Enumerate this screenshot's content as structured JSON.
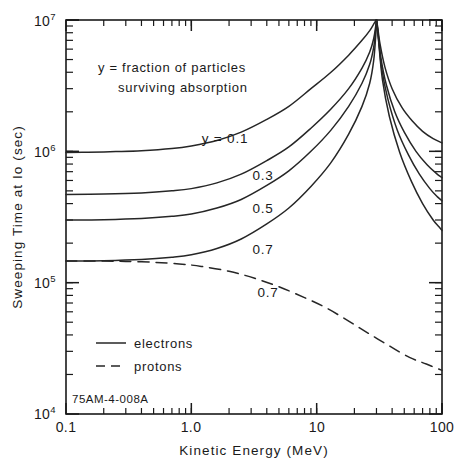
{
  "figure": {
    "id_label": "75AM-4-008A",
    "annotation_line1": "y = fraction of particles",
    "annotation_line2": "surviving absorption"
  },
  "chart_data": {
    "type": "line",
    "title": "",
    "xlabel": "Kinetic Energy (MeV)",
    "ylabel": "Sweeping Time at Io (sec)",
    "xscale": "log",
    "yscale": "log",
    "xlim": [
      0.1,
      100
    ],
    "ylim": [
      10000,
      10000000
    ],
    "grid": false,
    "xtick_labels": [
      "0.1",
      "1.0",
      "10",
      "100"
    ],
    "xtick_values": [
      0.1,
      1.0,
      10,
      100
    ],
    "ytick_labels": [
      "10",
      "10",
      "10",
      "10"
    ],
    "ytick_exponents": [
      "4",
      "5",
      "6",
      "7"
    ],
    "ytick_values": [
      10000,
      100000,
      1000000,
      10000000
    ],
    "annotations": [
      {
        "text": "y = 0.1",
        "x": 1.1,
        "y": 1350000
      },
      {
        "text": "0.3",
        "x": 2.0,
        "y": 640000
      },
      {
        "text": "0.5",
        "x": 2.0,
        "y": 390000
      },
      {
        "text": "0.7",
        "x": 2.0,
        "y": 215000
      },
      {
        "text": "0.7",
        "x": 2.6,
        "y": 98000
      }
    ],
    "legend_position": "lower left",
    "legend": [
      {
        "name": "electrons",
        "style": "solid"
      },
      {
        "name": "protons",
        "style": "dashed"
      }
    ],
    "series": [
      {
        "name": "y = 0.1 electrons",
        "style": "solid",
        "particle": "electrons",
        "y_fraction": 0.1,
        "x": [
          0.1,
          0.15,
          0.25,
          0.4,
          0.7,
          1.0,
          1.6,
          2.5,
          4.0,
          6.0,
          9.0,
          13.0,
          18.0,
          23.0,
          26.5,
          28.5,
          29.6,
          30.0
        ],
        "y": [
          980000,
          985000,
          995000,
          1010000,
          1050000,
          1100000,
          1210000,
          1400000,
          1750000,
          2200000,
          3000000,
          4000000,
          5400000,
          7000000,
          8300000,
          9300000,
          9850000,
          10000000
        ]
      },
      {
        "name": "y = 0.1 electrons (upper branch)",
        "style": "solid",
        "particle": "electrons",
        "y_fraction": 0.1,
        "branch": "right",
        "x": [
          30.0,
          30.6,
          32.0,
          35.0,
          40.0,
          48.0,
          58.0,
          70.0,
          85.0,
          100.0
        ],
        "y": [
          10000000,
          9000000,
          6600000,
          4400000,
          3000000,
          2150000,
          1700000,
          1420000,
          1250000,
          1160000
        ]
      },
      {
        "name": "y = 0.3 electrons",
        "style": "solid",
        "particle": "electrons",
        "y_fraction": 0.3,
        "x": [
          0.1,
          0.2,
          0.4,
          0.7,
          1.0,
          1.6,
          2.5,
          4.0,
          6.0,
          9.0,
          13.0,
          18.0,
          23.0,
          26.5,
          28.5,
          29.6,
          30.0
        ],
        "y": [
          470000,
          473000,
          482000,
          500000,
          520000,
          575000,
          670000,
          850000,
          1080000,
          1500000,
          2100000,
          3000000,
          4300000,
          5700000,
          7200000,
          9000000,
          10000000
        ]
      },
      {
        "name": "y = 0.3 electrons (upper branch)",
        "style": "solid",
        "particle": "electrons",
        "y_fraction": 0.3,
        "branch": "right",
        "x": [
          30.0,
          30.8,
          32.5,
          36.0,
          42.0,
          50.0,
          62.0,
          76.0,
          90.0,
          100.0
        ],
        "y": [
          10000000,
          8200000,
          5200000,
          3200000,
          2000000,
          1400000,
          1000000,
          790000,
          680000,
          630000
        ]
      },
      {
        "name": "y = 0.5 electrons",
        "style": "solid",
        "particle": "electrons",
        "y_fraction": 0.5,
        "x": [
          0.1,
          0.2,
          0.4,
          0.7,
          1.0,
          1.6,
          2.5,
          4.0,
          6.0,
          9.0,
          13.0,
          18.0,
          23.0,
          26.5,
          28.5,
          29.6,
          30.0
        ],
        "y": [
          300000,
          302000,
          308000,
          320000,
          333000,
          370000,
          430000,
          550000,
          710000,
          1000000,
          1450000,
          2200000,
          3300000,
          4600000,
          6200000,
          8400000,
          10000000
        ]
      },
      {
        "name": "y = 0.5 electrons (upper branch)",
        "style": "solid",
        "particle": "electrons",
        "y_fraction": 0.5,
        "branch": "right",
        "x": [
          30.0,
          31.0,
          33.0,
          37.0,
          44.0,
          54.0,
          66.0,
          80.0,
          92.0,
          100.0
        ],
        "y": [
          10000000,
          7600000,
          4300000,
          2500000,
          1450000,
          940000,
          670000,
          520000,
          450000,
          420000
        ]
      },
      {
        "name": "y = 0.7 electrons",
        "style": "solid",
        "particle": "electrons",
        "y_fraction": 0.7,
        "x": [
          0.1,
          0.2,
          0.4,
          0.7,
          1.0,
          1.6,
          2.5,
          4.0,
          6.0,
          9.0,
          13.0,
          18.0,
          23.0,
          26.5,
          28.5,
          29.6,
          30.0
        ],
        "y": [
          146000,
          147000,
          150000,
          156000,
          163000,
          182000,
          215000,
          280000,
          370000,
          540000,
          820000,
          1350000,
          2200000,
          3300000,
          4900000,
          7600000,
          10000000
        ]
      },
      {
        "name": "y = 0.7 electrons (upper branch)",
        "style": "solid",
        "particle": "electrons",
        "y_fraction": 0.7,
        "branch": "right",
        "x": [
          30.0,
          31.2,
          33.5,
          38.0,
          46.0,
          57.0,
          70.0,
          85.0,
          95.0,
          100.0
        ],
        "y": [
          10000000,
          6900000,
          3500000,
          1850000,
          980000,
          590000,
          400000,
          300000,
          265000,
          250000
        ]
      },
      {
        "name": "y = 0.7 protons",
        "style": "dashed",
        "particle": "protons",
        "y_fraction": 0.7,
        "x": [
          0.1,
          0.2,
          0.3,
          0.5,
          0.8,
          1.2,
          2.0,
          3.2,
          5.0,
          8.0,
          12.0,
          18.0,
          26.0,
          38.0,
          55.0,
          75.0,
          100.0
        ],
        "y": [
          146000,
          146000,
          145000,
          143000,
          139000,
          133000,
          122000,
          108000,
          93000,
          77000,
          64000,
          51000,
          41000,
          33000,
          27000,
          24000,
          21500
        ]
      }
    ]
  }
}
